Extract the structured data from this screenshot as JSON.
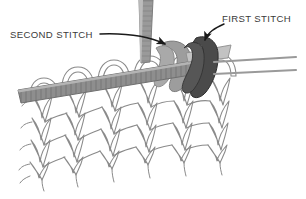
{
  "figure": {
    "background_color": "#ffffff",
    "width": 306,
    "height": 199
  },
  "labels": {
    "second_stitch": "SECOND STITCH",
    "first_stitch": "FIRST STITCH"
  },
  "colors": {
    "text": "#3a3a3a",
    "arrow": "#1a1a1a",
    "needle_fill": "#8e8e8e",
    "needle_stroke": "#6f6f6f",
    "needle_hatch": "#6b6b6b",
    "yarn_fill": "#ffffff",
    "yarn_stroke": "#8a8a8a",
    "first_stitch_loop": "#4a4a4a",
    "second_stitch_loop": "#9d9d9d",
    "background": "#ffffff"
  },
  "elements": {
    "fabric_name": "knitted stockinette fabric",
    "vertical_needle_name": "vertical knitting needle",
    "horizontal_needle_name": "horizontal knitting needle",
    "right_needle_tips": 2,
    "stitch_columns": 6,
    "stitch_rows": 5
  }
}
